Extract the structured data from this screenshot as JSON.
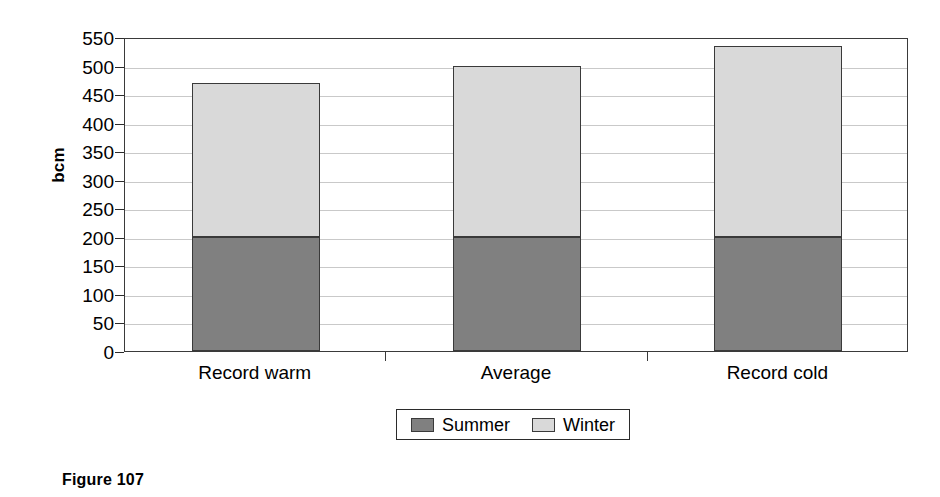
{
  "caption": "Figure 107",
  "chart_data": {
    "type": "bar",
    "stacked": true,
    "title": "",
    "xlabel": "",
    "ylabel": "bcm",
    "categories": [
      "Record warm",
      "Average",
      "Record cold"
    ],
    "series": [
      {
        "name": "Summer",
        "values": [
          200,
          200,
          200
        ],
        "color": "#808080"
      },
      {
        "name": "Winter",
        "values": [
          270,
          300,
          335
        ],
        "color": "#d9d9d9"
      }
    ],
    "totals": [
      470,
      500,
      535
    ],
    "ylim": [
      0,
      550
    ],
    "ytick_step": 50,
    "yticks": [
      550,
      500,
      450,
      400,
      350,
      300,
      250,
      200,
      150,
      100,
      50,
      0
    ],
    "ytick_labels": [
      "550",
      "500",
      "450",
      "400",
      "350",
      "300",
      "250",
      "200",
      "150",
      "100",
      "50",
      "0"
    ],
    "grid": true,
    "grid_axis": "y",
    "legend_position": "bottom-center",
    "legend_entries": [
      "Summer",
      "Winter"
    ],
    "axis_color": "#3a3a3a",
    "gridline_color": "#c9c9c9",
    "background": "#ffffff"
  }
}
